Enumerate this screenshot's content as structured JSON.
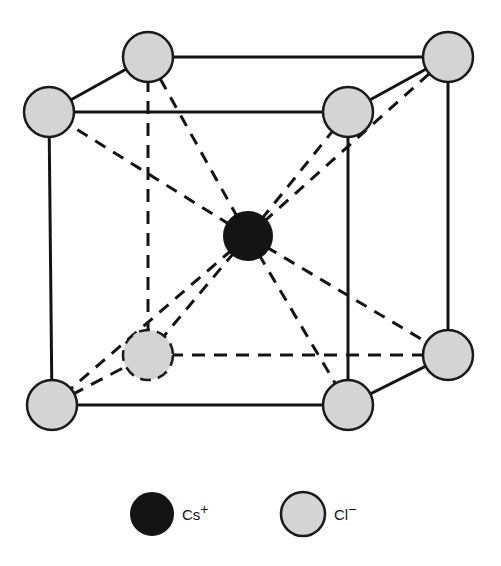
{
  "figure": {
    "background_color": "#ffffff"
  },
  "colors": {
    "anion_fill": "#d4d4d4",
    "anion_stroke": "#1a1a1a",
    "cation_fill": "#141414",
    "cation_stroke": "#141414",
    "edge_solid": "#141414",
    "edge_dashed": "#141414",
    "bond_dashed": "#141414",
    "label_text": "#141414"
  },
  "geometry": {
    "anion_radius": 25,
    "cation_radius": 24,
    "edge_width": 3,
    "dash_width": 3,
    "bond_dash_width": 3,
    "edge_dasharray": "13,9",
    "bond_dasharray": "12,9"
  },
  "structure": {
    "cation": {
      "id": "cs-center",
      "species": "Cs+",
      "site": "body-center",
      "x": 248,
      "y": 236
    },
    "anions": [
      {
        "id": "cl-back-top-left",
        "species": "Cl-",
        "site": "corner",
        "x": 148,
        "y": 57,
        "hidden_edges": false
      },
      {
        "id": "cl-back-top-right",
        "species": "Cl-",
        "site": "corner",
        "x": 448,
        "y": 57,
        "hidden_edges": false
      },
      {
        "id": "cl-front-top-left",
        "species": "Cl-",
        "site": "corner",
        "x": 49,
        "y": 112,
        "hidden_edges": false
      },
      {
        "id": "cl-front-top-right",
        "species": "Cl-",
        "site": "corner",
        "x": 348,
        "y": 112,
        "hidden_edges": false
      },
      {
        "id": "cl-back-bottom-left",
        "species": "Cl-",
        "site": "corner",
        "x": 148,
        "y": 355,
        "hidden_edges": true
      },
      {
        "id": "cl-back-bottom-right",
        "species": "Cl-",
        "site": "corner",
        "x": 448,
        "y": 355,
        "hidden_edges": false
      },
      {
        "id": "cl-front-bottom-left",
        "species": "Cl-",
        "site": "corner",
        "x": 52,
        "y": 405,
        "hidden_edges": false
      },
      {
        "id": "cl-front-bottom-right",
        "species": "Cl-",
        "site": "corner",
        "x": 348,
        "y": 405,
        "hidden_edges": false
      }
    ],
    "solid_edges": [
      {
        "name": "edge-back-top",
        "x1": 148,
        "y1": 57,
        "x2": 448,
        "y2": 57
      },
      {
        "name": "edge-front-top",
        "x1": 49,
        "y1": 112,
        "x2": 348,
        "y2": 112
      },
      {
        "name": "edge-front-bottom",
        "x1": 52,
        "y1": 405,
        "x2": 348,
        "y2": 405
      },
      {
        "name": "edge-front-left-vertical",
        "x1": 49,
        "y1": 112,
        "x2": 52,
        "y2": 405
      },
      {
        "name": "edge-front-right-vertical",
        "x1": 348,
        "y1": 112,
        "x2": 348,
        "y2": 405
      },
      {
        "name": "edge-back-right-vertical",
        "x1": 448,
        "y1": 57,
        "x2": 448,
        "y2": 355
      },
      {
        "name": "edge-top-left-oblique",
        "x1": 49,
        "y1": 112,
        "x2": 148,
        "y2": 57
      },
      {
        "name": "edge-top-right-oblique",
        "x1": 348,
        "y1": 112,
        "x2": 448,
        "y2": 57
      },
      {
        "name": "edge-bottom-right-oblique",
        "x1": 348,
        "y1": 405,
        "x2": 448,
        "y2": 355
      }
    ],
    "dashed_edges": [
      {
        "name": "edge-back-left-vertical",
        "x1": 148,
        "y1": 57,
        "x2": 148,
        "y2": 355
      },
      {
        "name": "edge-back-bottom",
        "x1": 148,
        "y1": 355,
        "x2": 448,
        "y2": 355
      },
      {
        "name": "edge-bottom-left-oblique",
        "x1": 52,
        "y1": 405,
        "x2": 148,
        "y2": 355
      }
    ],
    "bonds": [
      {
        "name": "bond-to-back-top-left",
        "x2": 148,
        "y2": 57
      },
      {
        "name": "bond-to-back-top-right",
        "x2": 448,
        "y2": 57
      },
      {
        "name": "bond-to-front-top-left",
        "x2": 49,
        "y2": 112
      },
      {
        "name": "bond-to-front-top-right",
        "x2": 348,
        "y2": 112
      },
      {
        "name": "bond-to-back-bottom-left",
        "x2": 148,
        "y2": 355
      },
      {
        "name": "bond-to-back-bottom-right",
        "x2": 448,
        "y2": 355
      },
      {
        "name": "bond-to-front-bottom-left",
        "x2": 52,
        "y2": 405
      },
      {
        "name": "bond-to-front-bottom-right",
        "x2": 348,
        "y2": 405
      }
    ]
  },
  "legend": {
    "items": [
      {
        "id": "legend-cation",
        "symbol": "Cs",
        "charge": "+",
        "label": "Cs+",
        "swatch_x": 152,
        "swatch_y": 514,
        "swatch_r": 21,
        "text_x": 182,
        "text_y": 520
      },
      {
        "id": "legend-anion",
        "symbol": "Cl",
        "charge": "−",
        "label": "Cl−",
        "swatch_x": 303,
        "swatch_y": 514,
        "swatch_r": 22,
        "text_x": 334,
        "text_y": 520
      }
    ]
  }
}
